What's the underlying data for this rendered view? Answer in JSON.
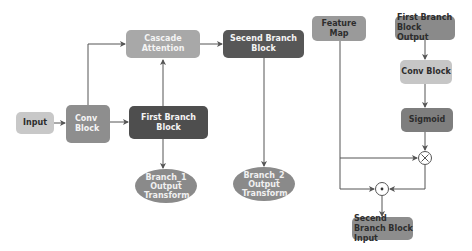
{
  "diagram": {
    "left_panel": {
      "input": "Input",
      "conv_block": "Conv Block",
      "first_branch_block": "First Branch Block",
      "cascade_attention": "Cascade Attention",
      "second_branch_block": "Secend Branch Block",
      "branch1_output": "Branch_1 Output Transform",
      "branch2_output": "Branch_2 Output Transform"
    },
    "right_panel": {
      "feature_map": "Feature Map",
      "first_branch_output": "First Branch Block Output",
      "conv_block": "Conv Block",
      "sigmoid": "Sigmoid",
      "multiply_op": "⊗",
      "elementwise_op": "⊙",
      "second_branch_input": "Secend Branch Block Input"
    },
    "colors": {
      "input": "#c8c8c8",
      "conv_block": "#8e8e8e",
      "first_branch_block": "#4e4e4e",
      "cascade_attention": "#a8a8a8",
      "second_branch_block": "#575757",
      "branch_ellipse": "#8a8a8a",
      "feature_map": "#9a9a9a",
      "first_branch_output": "#8a8a8a",
      "right_conv_block": "#c6c6c6",
      "sigmoid": "#7e7e7e",
      "second_branch_input": "#8d8d8d",
      "arrow": "#555555"
    }
  }
}
